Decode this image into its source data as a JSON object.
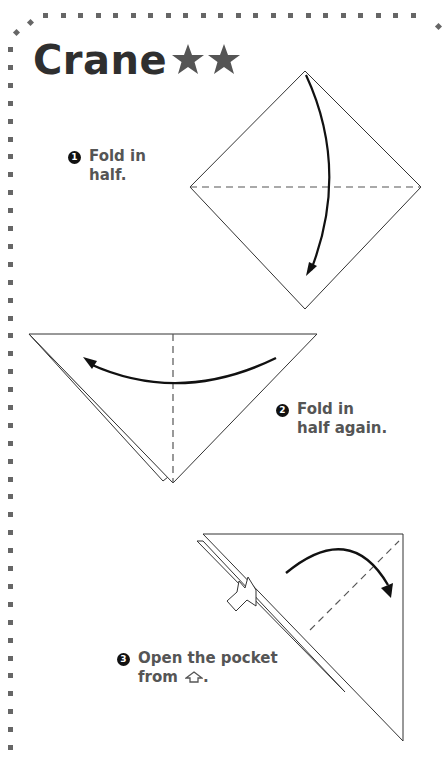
{
  "title": "Crane",
  "difficulty": {
    "stars": 2,
    "icon": "star-icon",
    "color": "#555555"
  },
  "border": {
    "style": "dotted-square",
    "color": "#666666"
  },
  "steps": [
    {
      "number": "1",
      "line1": "Fold in",
      "line2": "half."
    },
    {
      "number": "2",
      "line1": "Fold in",
      "line2": "half again."
    },
    {
      "number": "3",
      "line1": "Open the pocket",
      "line2": "from",
      "icon": "pocket-arrow-icon",
      "suffix": "."
    }
  ]
}
